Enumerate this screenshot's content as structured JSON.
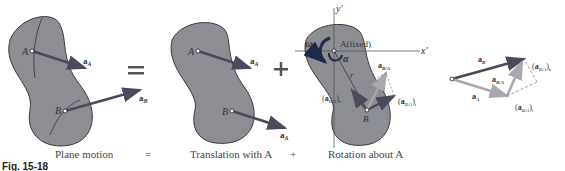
{
  "captions": {
    "plane_motion": "Plane motion",
    "equals": "=",
    "translation": "Translation with A",
    "plus": "+",
    "rotation": "Rotation about A"
  },
  "figure_label": "Fig. 15-18",
  "labels": {
    "point_a": "A",
    "point_b": "B",
    "a_A": "a",
    "a_A_sub": "A",
    "a_B": "a",
    "a_B_sub": "B",
    "y_axis": "y′",
    "x_axis": "x′",
    "a_fixed": "A(fixed)",
    "omega": "ω",
    "alpha": "α",
    "r": "r",
    "a_BA": "a",
    "a_BA_sub": "B/A",
    "a_BA_n": "(a",
    "a_BA_n_sub": "B/A",
    "a_BA_n_close": ")n",
    "a_BA_t": "(a",
    "a_BA_t_sub": "B/A",
    "a_BA_t_close": ")t"
  },
  "colors": {
    "body_fill": "#8d8d94",
    "body_stroke": "#3a3a3a",
    "vector_dark": "#4a4a5a",
    "vector_light": "#a8a8ae",
    "omega_arc": "#1e2a4a"
  }
}
